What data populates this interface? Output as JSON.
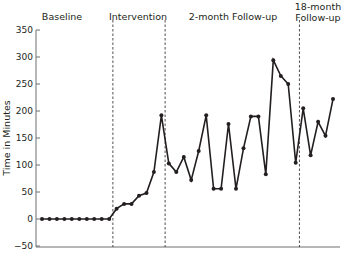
{
  "chart_data": {
    "type": "line",
    "title": "",
    "xlabel": "",
    "ylabel": "Time in Minutes",
    "ylim": [
      -50,
      350
    ],
    "yticks": [
      350,
      300,
      250,
      200,
      150,
      100,
      50,
      0,
      -50
    ],
    "ytick_labels": [
      "350",
      "300",
      "250",
      "200",
      "150",
      "100",
      "50",
      "0",
      "−50"
    ],
    "grid": false,
    "legend": "none",
    "phases": [
      {
        "label_lines": [
          "Baseline"
        ],
        "start_index": 0,
        "end_index": 9
      },
      {
        "label_lines": [
          "Intervention"
        ],
        "start_index": 10,
        "end_index": 16
      },
      {
        "label_lines": [
          "2-month Follow-up"
        ],
        "start_index": 17,
        "end_index": 34
      },
      {
        "label_lines": [
          "18-month",
          "Follow-up"
        ],
        "start_index": 35,
        "end_index": 39
      }
    ],
    "phase_dividers_after_index": [
      9,
      16,
      34
    ],
    "series": [
      {
        "name": "Time in Minutes",
        "color": "#231f20",
        "values": [
          0,
          0,
          0,
          0,
          0,
          0,
          0,
          0,
          0,
          0,
          19,
          28,
          28,
          43,
          48,
          87,
          192,
          103,
          87,
          115,
          72,
          126,
          192,
          56,
          56,
          176,
          56,
          131,
          190,
          190,
          83,
          294,
          265,
          250,
          104,
          205,
          118,
          180,
          154,
          222
        ]
      }
    ]
  }
}
